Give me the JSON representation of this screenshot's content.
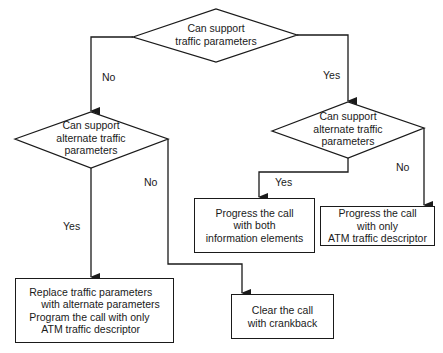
{
  "diagram": {
    "type": "flowchart",
    "decisions": [
      {
        "id": "d1",
        "lines": [
          "Can support",
          "traffic parameters"
        ]
      },
      {
        "id": "d2",
        "lines": [
          "Can support",
          "alternate traffic",
          "parameters"
        ]
      },
      {
        "id": "d3",
        "lines": [
          "Can support",
          "alternate traffic",
          "parameters"
        ]
      }
    ],
    "processes": [
      {
        "id": "p1",
        "lines": [
          "Progress the call",
          "with both",
          "information elements"
        ]
      },
      {
        "id": "p2",
        "lines": [
          "Progress the call",
          "with only",
          "ATM traffic descriptor"
        ]
      },
      {
        "id": "p3",
        "lines": [
          "Replace traffic parameters",
          "with alternate parameters",
          "Program the call with only",
          "ATM traffic descriptor"
        ]
      },
      {
        "id": "p4",
        "lines": [
          "Clear the call",
          "with crankback"
        ]
      }
    ],
    "edge_labels": {
      "d1_no": "No",
      "d1_yes": "Yes",
      "d2_yes": "Yes",
      "d2_no": "No",
      "d3_yes": "Yes",
      "d3_no": "No"
    },
    "edges": [
      {
        "from": "d1",
        "to": "d2",
        "label": "No"
      },
      {
        "from": "d1",
        "to": "d3",
        "label": "Yes"
      },
      {
        "from": "d2",
        "to": "p3",
        "label": "Yes"
      },
      {
        "from": "d2",
        "to": "p4",
        "label": "No"
      },
      {
        "from": "d3",
        "to": "p1",
        "label": "Yes"
      },
      {
        "from": "d3",
        "to": "p2",
        "label": "No"
      }
    ],
    "colors": {
      "stroke": "#1a1a1a",
      "background": "#ffffff"
    }
  }
}
